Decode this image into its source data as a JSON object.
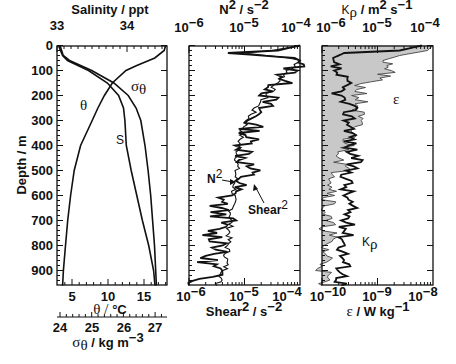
{
  "chart_data": [
    {
      "type": "line",
      "panel": "left",
      "title": "",
      "ylabel": "Depth / m",
      "ylim": [
        0,
        960
      ],
      "yticks": [
        "0",
        "100",
        "200",
        "300",
        "400",
        "500",
        "600",
        "700",
        "800",
        "900"
      ],
      "axes": {
        "top": {
          "label": "Salinity / ppt",
          "ticks": [
            "33",
            "34"
          ],
          "range": [
            33,
            34.57
          ]
        },
        "bottom": {
          "label_prefix": "θ / ",
          "label_unit": "°C",
          "ticks": [
            "5",
            "10",
            "15"
          ],
          "range": [
            3,
            18.3
          ]
        },
        "bottom2": {
          "label_prefix": "σ",
          "label_sub": "θ",
          "label_suffix": " / kg m",
          "label_sup": "−3",
          "ticks": [
            "24",
            "25",
            "26",
            "27"
          ],
          "range": [
            24,
            27.3
          ]
        }
      },
      "series": [
        {
          "name": "θ",
          "axis": "bottom",
          "depth": [
            0,
            20,
            50,
            80,
            100,
            150,
            200,
            250,
            300,
            350,
            400,
            500,
            600,
            700,
            800,
            900,
            960
          ],
          "values": [
            18.0,
            17.8,
            16.5,
            14.0,
            12.5,
            10.6,
            9.5,
            8.6,
            7.8,
            7.0,
            6.2,
            5.3,
            4.8,
            4.4,
            4.1,
            3.8,
            3.7
          ]
        },
        {
          "name": "S",
          "axis": "top",
          "depth": [
            0,
            20,
            40,
            60,
            100,
            150,
            200,
            250,
            300,
            400,
            500,
            600,
            700,
            800,
            900,
            960
          ],
          "values": [
            33.02,
            33.05,
            33.08,
            33.15,
            33.45,
            33.72,
            33.88,
            33.95,
            33.97,
            33.99,
            34.06,
            34.14,
            34.22,
            34.31,
            34.38,
            34.4
          ]
        },
        {
          "name": "σθ",
          "axis": "bottom2",
          "depth": [
            0,
            20,
            40,
            60,
            100,
            150,
            200,
            250,
            300,
            400,
            500,
            600,
            700,
            800,
            900,
            960
          ],
          "values": [
            24.0,
            24.05,
            24.1,
            24.3,
            25.0,
            25.7,
            26.15,
            26.4,
            26.55,
            26.68,
            26.78,
            26.86,
            26.92,
            26.98,
            27.02,
            27.04
          ]
        }
      ],
      "annotations": [
        "θ",
        "S",
        "σθ"
      ]
    },
    {
      "type": "line",
      "panel": "middle",
      "axes": {
        "top": {
          "label": "N² / s⁻²",
          "ticks": [
            "10⁻⁶",
            "10⁻⁵",
            "10⁻⁴"
          ],
          "scale": "log",
          "range": [
            1e-06,
            0.0001
          ]
        },
        "bottom": {
          "label": "Shear² / s⁻²",
          "ticks": [
            "10⁻⁶",
            "10⁻⁵",
            "10⁻⁴"
          ],
          "scale": "log",
          "range": [
            1e-06,
            0.0001
          ]
        }
      },
      "ylim": [
        0,
        960
      ],
      "series": [
        {
          "name": "N²",
          "depth": [
            0,
            20,
            30,
            50,
            60,
            100,
            150,
            200,
            250,
            300,
            350,
            400,
            450,
            500,
            550,
            600,
            700,
            800,
            900,
            960
          ],
          "log10_values": [
            -4.0,
            -4.5,
            -5.0,
            -4.2,
            -4.0,
            -4.2,
            -4.4,
            -4.6,
            -4.8,
            -4.95,
            -5.05,
            -5.1,
            -5.12,
            -5.15,
            -5.17,
            -5.2,
            -5.25,
            -5.3,
            -5.35,
            -5.5
          ]
        },
        {
          "name": "Shear²",
          "depth": [
            0,
            20,
            30,
            50,
            60,
            100,
            150,
            200,
            250,
            300,
            350,
            400,
            450,
            500,
            550,
            600,
            650,
            700,
            750,
            800,
            850,
            900,
            950,
            960
          ],
          "log10_values": [
            -4.0,
            -4.4,
            -5.3,
            -4.1,
            -4.0,
            -4.15,
            -4.35,
            -4.55,
            -4.7,
            -4.85,
            -4.9,
            -4.95,
            -5.0,
            -4.9,
            -5.1,
            -5.3,
            -5.5,
            -5.35,
            -5.6,
            -5.35,
            -5.7,
            -5.5,
            -5.8,
            -6.0
          ]
        }
      ],
      "annotations": [
        "N²",
        "Shear²"
      ]
    },
    {
      "type": "area",
      "panel": "right",
      "axes": {
        "top": {
          "label": "Kρ / m² s⁻¹",
          "ticks": [
            "10⁻⁶",
            "10⁻⁵",
            "10⁻⁴"
          ],
          "scale": "log",
          "range": [
            1e-06,
            0.0001
          ]
        },
        "bottom": {
          "label": "ε / W kg⁻¹",
          "ticks": [
            "10⁻¹⁰",
            "10⁻⁹",
            "10⁻⁸"
          ],
          "scale": "log",
          "range": [
            1e-10,
            1e-08
          ]
        }
      },
      "ylim": [
        0,
        960
      ],
      "series": [
        {
          "name": "ε",
          "fill": "#c8c8c8",
          "depth": [
            0,
            20,
            40,
            60,
            80,
            100,
            130,
            160,
            200,
            250,
            300,
            350,
            400,
            450,
            500,
            550,
            600,
            650,
            700,
            750,
            800,
            850,
            900,
            960
          ],
          "log10_values": [
            -8.0,
            -8.1,
            -8.6,
            -8.9,
            -8.9,
            -8.75,
            -9.0,
            -9.3,
            -9.3,
            -9.35,
            -9.4,
            -9.45,
            -9.55,
            -9.6,
            -9.65,
            -9.75,
            -9.8,
            -9.9,
            -9.95,
            -9.85,
            -9.95,
            -9.9,
            -9.95,
            -10.0
          ]
        },
        {
          "name": "Kρ",
          "depth": [
            0,
            20,
            30,
            50,
            100,
            150,
            200,
            250,
            300,
            350,
            400,
            450,
            500,
            550,
            600,
            650,
            700,
            750,
            800,
            850,
            900,
            960
          ],
          "log10_values": [
            -4.2,
            -4.6,
            -5.6,
            -5.8,
            -5.75,
            -5.6,
            -5.7,
            -5.5,
            -5.5,
            -5.45,
            -5.5,
            -5.4,
            -5.5,
            -5.55,
            -5.55,
            -5.5,
            -5.55,
            -5.55,
            -5.6,
            -5.6,
            -5.6,
            -5.65
          ]
        }
      ],
      "annotations": [
        "ε",
        "Kρ"
      ]
    }
  ],
  "labels": {
    "left_top": "Salinity / ppt",
    "depth": "Depth / m",
    "theta_prefix": "θ / ",
    "theta_unit": "°C",
    "sigma": "σ",
    "sigma_sub": "θ",
    "sigma_unit": " / kg m",
    "sigma_sup": "−3",
    "mid_top_base": "N",
    "mid_top_sup": "2",
    "mid_top_unit": " / s",
    "mid_top_unit_sup": "−2",
    "mid_bottom_base": "Shear",
    "mid_bottom_sup": "2",
    "mid_bottom_unit": " / s",
    "mid_bottom_unit_sup": "−2",
    "right_top_base": "K",
    "right_top_sub": "ρ",
    "right_top_unit": " / m",
    "right_top_unit_sup1": "2",
    "right_top_unit2": " s",
    "right_top_unit_sup2": "−1",
    "right_bottom_base": "ε",
    "right_bottom_unit": " / W kg",
    "right_bottom_unit_sup": "−1",
    "anno_theta": "θ",
    "anno_S": "S",
    "anno_sigma": "σ",
    "anno_sigma_sub": "θ",
    "anno_N2": "N",
    "anno_N2_sup": "2",
    "anno_shear": "Shear",
    "anno_shear_sup": "2",
    "anno_eps": "ε",
    "anno_K": "K",
    "anno_K_sub": "ρ"
  },
  "ticks": {
    "depth": [
      "0",
      "100",
      "200",
      "300",
      "400",
      "500",
      "600",
      "700",
      "800",
      "900"
    ],
    "salinity": [
      "33",
      "34"
    ],
    "theta": [
      "5",
      "10",
      "15"
    ],
    "sigma": [
      "24",
      "25",
      "26",
      "27"
    ],
    "decade_base": "10",
    "mid_top_exp": [
      "−6",
      "−5",
      "−4"
    ],
    "mid_bottom_exp": [
      "−6",
      "−5",
      "−4"
    ],
    "right_top_exp": [
      "−6",
      "−5",
      "−4"
    ],
    "right_bottom_exp": [
      "−10",
      "−9",
      "−8"
    ]
  }
}
